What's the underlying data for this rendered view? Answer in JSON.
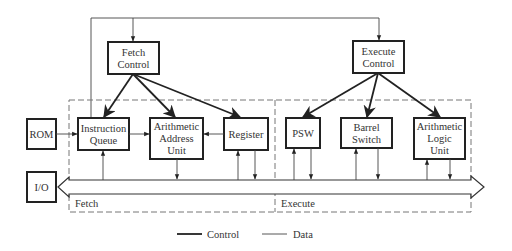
{
  "diagram": {
    "controllers": {
      "fetch": {
        "line1": "Fetch",
        "line2": "Control"
      },
      "execute": {
        "line1": "Execute",
        "line2": "Control"
      }
    },
    "external": {
      "rom": "ROM",
      "io": "I/O"
    },
    "fetch_units": {
      "instruction_queue": {
        "line1": "Instruction",
        "line2": "Queue"
      },
      "arithmetic_address_unit": {
        "line1": "Arithmetic",
        "line2": "Address",
        "line3": "Unit"
      },
      "register": "Register"
    },
    "execute_units": {
      "psw": "PSW",
      "barrel_switch": {
        "line1": "Barrel",
        "line2": "Switch"
      },
      "alu": {
        "line1": "Arithmetic",
        "line2": "Logic",
        "line3": "Unit"
      }
    },
    "sections": {
      "fetch": "Fetch",
      "execute": "Execute"
    },
    "legend": {
      "control": "Control",
      "data": "Data"
    }
  }
}
